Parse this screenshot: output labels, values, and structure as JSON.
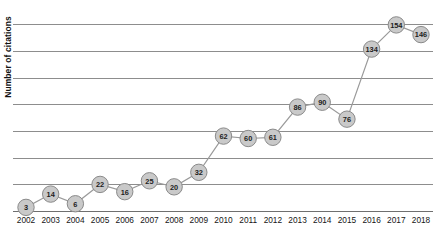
{
  "chart_data": {
    "type": "line",
    "title": "",
    "xlabel": "",
    "ylabel": "Number of citations",
    "categories": [
      "2002",
      "2003",
      "2004",
      "2005",
      "2006",
      "2007",
      "2008",
      "2009",
      "2010",
      "2011",
      "2012",
      "2013",
      "2014",
      "2015",
      "2016",
      "2017",
      "2018"
    ],
    "values": [
      3,
      14,
      6,
      22,
      16,
      25,
      20,
      32,
      62,
      60,
      61,
      86,
      90,
      76,
      134,
      154,
      146
    ],
    "ylim": [
      0,
      168
    ],
    "xlim": [
      "2002",
      "2018"
    ],
    "grid": true,
    "y_tick_labels_shown": false,
    "gridline_count": 8,
    "legend": "none",
    "marker": "circle-with-value-label",
    "colors": {
      "line": "#9a9a9a",
      "marker_fill": "#c9c9c9",
      "marker_stroke": "#8a8a8a",
      "label_text": "#1d1d1d",
      "gridline": "#8d8d8d",
      "axis": "#6f6f6f",
      "background": "#ffffff"
    }
  }
}
